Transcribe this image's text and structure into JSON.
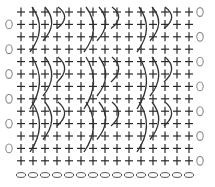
{
  "diagram": {
    "title": "",
    "type": "crochet/knit stitch chart",
    "columns": 15,
    "rows": 13,
    "grid_symbol": "plus",
    "row_end_symbol": "zero",
    "row_end_sides": [
      "right",
      "left",
      "right",
      "left",
      "right",
      "left",
      "right",
      "left",
      "right",
      "left",
      "right",
      "left",
      "right"
    ],
    "foundation_row": {
      "symbol": "oval-chain",
      "count": 15
    },
    "cable_groups": [
      {
        "band": 0,
        "columns_x": [
          33,
          46,
          59
        ]
      },
      {
        "band": 0,
        "columns_x": [
          87,
          100,
          113
        ]
      },
      {
        "band": 0,
        "columns_x": [
          140,
          153,
          166
        ]
      },
      {
        "band": 1,
        "columns_x": [
          33,
          46,
          59
        ]
      },
      {
        "band": 1,
        "columns_x": [
          87,
          100,
          113
        ]
      },
      {
        "band": 1,
        "columns_x": [
          140,
          153,
          166
        ]
      },
      {
        "band": 2,
        "columns_x": [
          33,
          46,
          59
        ]
      },
      {
        "band": 2,
        "columns_x": [
          87,
          100,
          113
        ]
      },
      {
        "band": 2,
        "columns_x": [
          140,
          153,
          166
        ]
      }
    ],
    "bands_y": [
      [
        5,
        50
      ],
      [
        55,
        107
      ],
      [
        100,
        150
      ]
    ],
    "colors": {
      "plus": "#2a2a2a",
      "zero": "#8a8a8a",
      "arc": "#333333",
      "oval": "#555555",
      "background": "#ffffff"
    }
  }
}
